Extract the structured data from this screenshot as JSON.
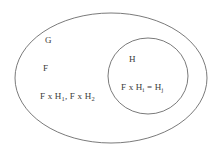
{
  "diagram": {
    "type": "venn-diagram",
    "title": "",
    "stroke_color": "#6b6b6b",
    "text_color": "#3b3b3b",
    "background_color": "#ffffff",
    "outer_set": {
      "name": "outer-ellipse",
      "shape": "ellipse",
      "cx": 111,
      "cy": 78,
      "rx": 96,
      "ry": 65,
      "labels": {
        "group": "G",
        "subgroup": "F",
        "products_prefix": "F x H",
        "products_sub_1": "1",
        "products_separator": ", F x H",
        "products_sub_2": "2",
        "products_full": "F x H1, F x H2"
      }
    },
    "inner_set": {
      "name": "inner-ellipse",
      "shape": "ellipse",
      "cx": 148,
      "cy": 76,
      "rx": 40,
      "ry": 38,
      "labels": {
        "subgroup": "H",
        "relation_prefix": "F x H",
        "relation_sub_i": "i",
        "relation_equals": " = H",
        "relation_sub_j": "j",
        "relation_full": "F x Hi = Hj"
      }
    }
  }
}
